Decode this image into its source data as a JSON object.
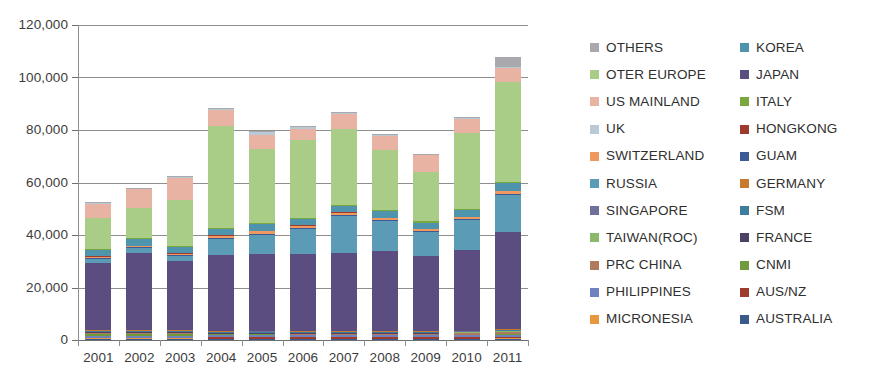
{
  "chart_data": {
    "type": "bar",
    "stacked": true,
    "title": "",
    "xlabel": "",
    "ylabel": "",
    "ylim": [
      0,
      120000
    ],
    "ytick_values": [
      0,
      20000,
      40000,
      60000,
      80000,
      100000,
      120000
    ],
    "ytick_labels": [
      "0",
      "20,000",
      "40,000",
      "60,000",
      "80,000",
      "100,000",
      "120,000"
    ],
    "grid": true,
    "legend_position": "right",
    "legend_columns": 2,
    "categories": [
      "2001",
      "2002",
      "2003",
      "2004",
      "2005",
      "2006",
      "2007",
      "2008",
      "2009",
      "2010",
      "2011"
    ],
    "totals": [
      52500,
      58000,
      62500,
      88500,
      79500,
      81500,
      87000,
      78500,
      71000,
      85000,
      108000
    ],
    "series": [
      {
        "name": "AUSTRALIA",
        "color": "#3b5a8c",
        "values": [
          300,
          300,
          300,
          250,
          250,
          250,
          250,
          250,
          250,
          250,
          300
        ]
      },
      {
        "name": "MICRONESIA",
        "color": "#e8973c",
        "values": [
          300,
          300,
          300,
          300,
          300,
          300,
          300,
          300,
          300,
          300,
          350
        ]
      },
      {
        "name": "AUS/NZ",
        "color": "#9e3b2e",
        "values": [
          250,
          250,
          250,
          700,
          650,
          600,
          600,
          600,
          600,
          650,
          700
        ]
      },
      {
        "name": "PHILIPPINES",
        "color": "#6f82bd",
        "values": [
          700,
          700,
          700,
          700,
          700,
          700,
          700,
          700,
          700,
          700,
          800
        ]
      },
      {
        "name": "CNMI",
        "color": "#6f9b3c",
        "values": [
          900,
          900,
          900,
          250,
          250,
          250,
          250,
          250,
          250,
          250,
          300
        ]
      },
      {
        "name": "PRC CHINA",
        "color": "#b07a5e",
        "values": [
          250,
          250,
          250,
          250,
          300,
          300,
          350,
          350,
          400,
          450,
          600
        ]
      },
      {
        "name": "FRANCE",
        "color": "#4d4168",
        "values": [
          200,
          200,
          200,
          200,
          200,
          200,
          200,
          200,
          200,
          200,
          250
        ]
      },
      {
        "name": "TAIWAN(ROC)",
        "color": "#8cb86a",
        "values": [
          250,
          250,
          250,
          250,
          250,
          250,
          250,
          250,
          250,
          250,
          300
        ]
      },
      {
        "name": "FSM",
        "color": "#3f7d9e",
        "values": [
          200,
          200,
          200,
          200,
          200,
          200,
          200,
          200,
          200,
          200,
          250
        ]
      },
      {
        "name": "SINGAPORE",
        "color": "#6e6f9b",
        "values": [
          200,
          200,
          200,
          200,
          200,
          200,
          200,
          200,
          200,
          200,
          250
        ]
      },
      {
        "name": "GERMANY",
        "color": "#c8792e",
        "values": [
          200,
          200,
          200,
          200,
          200,
          200,
          200,
          200,
          200,
          200,
          250
        ]
      },
      {
        "name": "JAPAN",
        "color": "#5b4d7f",
        "values": [
          25500,
          29500,
          26500,
          29500,
          29500,
          29500,
          30500,
          31500,
          29500,
          31500,
          38500
        ]
      },
      {
        "name": "RUSSIA",
        "color": "#5b9bb5",
        "values": [
          1500,
          1700,
          1800,
          6500,
          7500,
          9500,
          14500,
          11500,
          9500,
          11500,
          14500
        ]
      },
      {
        "name": "GUAM",
        "color": "#3b5a96",
        "values": [
          400,
          400,
          400,
          400,
          400,
          400,
          400,
          400,
          400,
          400,
          500
        ]
      },
      {
        "name": "SWITZERLAND",
        "color": "#f0995e",
        "values": [
          300,
          300,
          300,
          800,
          800,
          800,
          800,
          800,
          800,
          800,
          900
        ]
      },
      {
        "name": "HONGKONG",
        "color": "#9e3b2e",
        "values": [
          200,
          200,
          200,
          200,
          200,
          200,
          200,
          200,
          200,
          200,
          250
        ]
      },
      {
        "name": "KOREA",
        "color": "#4f94ad",
        "values": [
          2500,
          2500,
          2500,
          2500,
          2500,
          2500,
          2500,
          2500,
          2500,
          2500,
          3000
        ]
      },
      {
        "name": "ITALY",
        "color": "#7aa83f",
        "values": [
          400,
          400,
          400,
          500,
          500,
          500,
          500,
          500,
          500,
          500,
          600
        ]
      },
      {
        "name": "OTER EUROPE",
        "color": "#a9cc86",
        "values": [
          11500,
          11500,
          17500,
          39500,
          28500,
          29500,
          29500,
          23500,
          19500,
          29500,
          39500
        ]
      },
      {
        "name": "US MAINLAND",
        "color": "#e8b3a3",
        "values": [
          5500,
          7000,
          8500,
          6500,
          5500,
          4500,
          6000,
          5500,
          6500,
          5500,
          5500
        ]
      },
      {
        "name": "UK",
        "color": "#b9c9d6",
        "values": [
          250,
          250,
          250,
          400,
          900,
          650,
          400,
          400,
          350,
          400,
          400
        ]
      },
      {
        "name": "OTHERS",
        "color": "#a9a9ad",
        "values": [
          300,
          300,
          300,
          300,
          300,
          300,
          300,
          300,
          300,
          300,
          4000
        ]
      }
    ],
    "legend_entries": [
      {
        "label": "OTHERS",
        "color": "#a9a9ad"
      },
      {
        "label": "KOREA",
        "color": "#4f94ad"
      },
      {
        "label": "OTER EUROPE",
        "color": "#a9cc86"
      },
      {
        "label": "JAPAN",
        "color": "#5b4d7f"
      },
      {
        "label": "US MAINLAND",
        "color": "#e8b3a3"
      },
      {
        "label": "ITALY",
        "color": "#7aa83f"
      },
      {
        "label": "UK",
        "color": "#b9c9d6"
      },
      {
        "label": "HONGKONG",
        "color": "#9e3b2e"
      },
      {
        "label": "SWITZERLAND",
        "color": "#f0995e"
      },
      {
        "label": "GUAM",
        "color": "#3b5a96"
      },
      {
        "label": "RUSSIA",
        "color": "#5b9bb5"
      },
      {
        "label": "GERMANY",
        "color": "#c8792e"
      },
      {
        "label": "SINGAPORE",
        "color": "#6e6f9b"
      },
      {
        "label": "FSM",
        "color": "#3f7d9e"
      },
      {
        "label": "TAIWAN(ROC)",
        "color": "#8cb86a"
      },
      {
        "label": "FRANCE",
        "color": "#4d4168"
      },
      {
        "label": "PRC CHINA",
        "color": "#b07a5e"
      },
      {
        "label": "CNMI",
        "color": "#6f9b3c"
      },
      {
        "label": "PHILIPPINES",
        "color": "#6f82bd"
      },
      {
        "label": "AUS/NZ",
        "color": "#9e3b2e"
      },
      {
        "label": "MICRONESIA",
        "color": "#e8973c"
      },
      {
        "label": "AUSTRALIA",
        "color": "#3b5a8c"
      }
    ]
  }
}
